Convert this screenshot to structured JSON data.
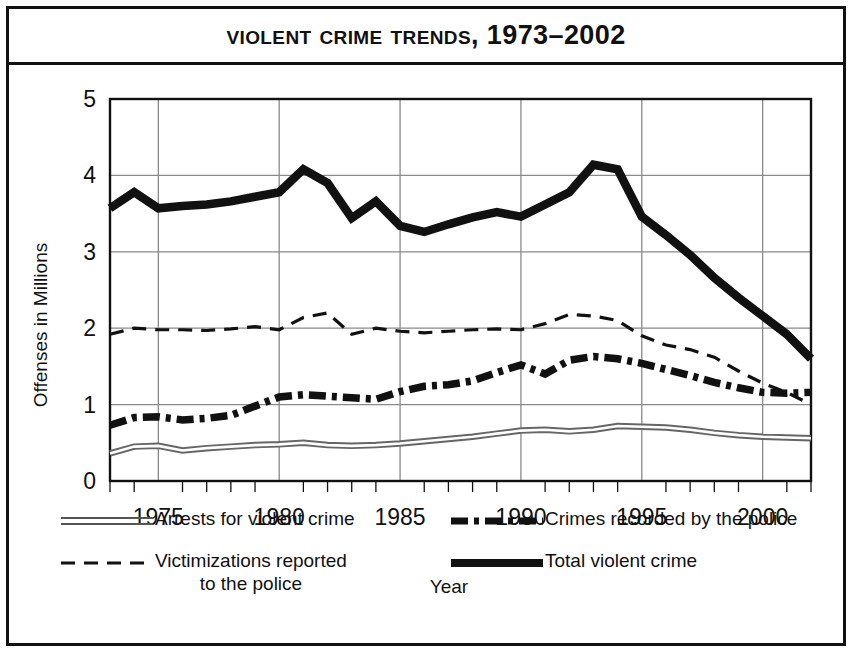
{
  "chart_title": "Violent Crime Trends, 1973–2002",
  "axes": {
    "ylabel": "Offenses in Millions",
    "xlabel": "Year",
    "yticks": [
      "0",
      "1",
      "2",
      "3",
      "4",
      "5"
    ],
    "xticks": [
      "1975",
      "1980",
      "1985",
      "1990",
      "1995",
      "2000"
    ]
  },
  "legend": {
    "arrests": "Arrests for violent crime",
    "recorded": "Crimes recorded by the police",
    "victim_line1": "Victimizations reported",
    "victim_line2": "to the police",
    "total": "Total violent crime"
  },
  "colors": {
    "ink": "#111111",
    "grid": "#8a8a8a",
    "frame": "#111111"
  },
  "chart_data": {
    "type": "line",
    "title": "Violent Crime Trends, 1973–2002",
    "xlabel": "Year",
    "ylabel": "Offenses in Millions",
    "xlim": [
      1973,
      2002
    ],
    "ylim": [
      0,
      5
    ],
    "grid": true,
    "legend_position": "below",
    "x": [
      1973,
      1974,
      1975,
      1976,
      1977,
      1978,
      1979,
      1980,
      1981,
      1982,
      1983,
      1984,
      1985,
      1986,
      1987,
      1988,
      1989,
      1990,
      1991,
      1992,
      1993,
      1994,
      1995,
      1996,
      1997,
      1998,
      1999,
      2000,
      2001,
      2002
    ],
    "series": [
      {
        "name": "Total violent crime",
        "style": "solid-thick",
        "values": [
          3.57,
          3.78,
          3.57,
          3.6,
          3.62,
          3.66,
          3.72,
          3.78,
          4.08,
          3.9,
          3.44,
          3.66,
          3.34,
          3.26,
          3.36,
          3.45,
          3.52,
          3.46,
          3.62,
          3.78,
          4.14,
          4.08,
          3.46,
          3.22,
          2.96,
          2.66,
          2.4,
          2.16,
          1.92,
          1.6
        ]
      },
      {
        "name": "Victimizations reported to the police",
        "style": "dashed",
        "values": [
          1.92,
          2.0,
          1.98,
          1.98,
          1.97,
          1.99,
          2.02,
          1.98,
          2.14,
          2.2,
          1.92,
          2.0,
          1.96,
          1.94,
          1.96,
          1.98,
          1.99,
          1.98,
          2.06,
          2.18,
          2.16,
          2.1,
          1.9,
          1.78,
          1.72,
          1.62,
          1.44,
          1.28,
          1.16,
          1.0
        ]
      },
      {
        "name": "Crimes recorded by the police",
        "style": "dash-dot",
        "values": [
          0.73,
          0.83,
          0.84,
          0.8,
          0.82,
          0.86,
          0.98,
          1.1,
          1.13,
          1.11,
          1.09,
          1.07,
          1.17,
          1.24,
          1.26,
          1.31,
          1.42,
          1.52,
          1.4,
          1.58,
          1.63,
          1.6,
          1.54,
          1.46,
          1.38,
          1.29,
          1.22,
          1.16,
          1.15,
          1.16
        ]
      },
      {
        "name": "Arrests for violent crime",
        "style": "double-line",
        "values": [
          0.36,
          0.45,
          0.46,
          0.4,
          0.43,
          0.45,
          0.47,
          0.48,
          0.5,
          0.47,
          0.46,
          0.47,
          0.49,
          0.52,
          0.55,
          0.58,
          0.62,
          0.66,
          0.67,
          0.65,
          0.67,
          0.72,
          0.71,
          0.7,
          0.67,
          0.63,
          0.6,
          0.58,
          0.57,
          0.56
        ]
      }
    ]
  }
}
